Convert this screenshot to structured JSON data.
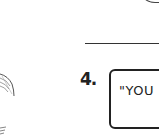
{
  "worksheet": {
    "question_number": "4.",
    "answer_box_text": "\"YOU (",
    "icons": {
      "top_right": "arc-drawing",
      "left": "feather-drawing",
      "bottom_left": "sketch-fragment"
    }
  }
}
